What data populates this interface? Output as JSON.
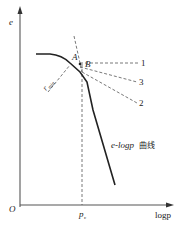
{
  "diagram": {
    "axes": {
      "y_label": "e",
      "x_label": "logp",
      "origin": "O"
    },
    "points": {
      "A": "A",
      "B": "B"
    },
    "lines": {
      "line1": "1",
      "line2": "2",
      "line3": "3"
    },
    "r_min_label": "r",
    "r_min_sub": "min",
    "pc_label": "p",
    "pc_sub": "c",
    "curve_label_italic": "e-logp",
    "curve_label_cn": "曲线"
  }
}
